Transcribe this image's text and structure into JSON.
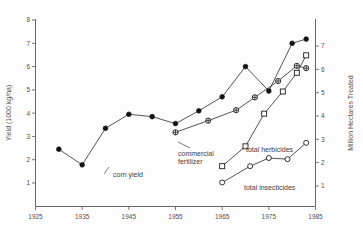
{
  "chart_data": {
    "type": "line",
    "title": "",
    "xlabel": "",
    "ylabel": "Yield  (1000 kg/ha)",
    "y2label": "Million Hectares Treated",
    "xlim": [
      1925,
      1985
    ],
    "ylim": [
      0,
      8
    ],
    "y2lim": [
      0,
      7.5
    ],
    "grid": false,
    "legend_position": "inline-annotations",
    "xticks": [
      "1925",
      "1935",
      "1945",
      "1955",
      "1965",
      "1975",
      "1985"
    ],
    "xtick_values": [
      1925,
      1935,
      1945,
      1955,
      1965,
      1975,
      1985
    ],
    "yticks": [
      "1",
      "2",
      "3",
      "4",
      "5",
      "6",
      "7",
      "8"
    ],
    "ytick_values": [
      1,
      2,
      3,
      4,
      5,
      6,
      7,
      8
    ],
    "y2ticks": [
      "1",
      "2",
      "3",
      "4",
      "5",
      "6",
      "7"
    ],
    "y2tick_values": [
      1,
      2,
      3,
      4,
      5,
      6,
      7
    ],
    "series": [
      {
        "name": "corn yield",
        "axis": "left",
        "marker": "filled-circle",
        "label": "corn yield",
        "x": [
          1930,
          1935,
          1940,
          1945,
          1950,
          1955,
          1960,
          1965,
          1970,
          1975,
          1980,
          1983
        ],
        "values": [
          2.45,
          1.78,
          3.35,
          3.95,
          3.85,
          3.55,
          4.1,
          4.7,
          6.0,
          4.95,
          7.0,
          7.18
        ]
      },
      {
        "name": "commercial fertilizer",
        "axis": "right",
        "marker": "crossed-circle",
        "label": "commercial fertilizer",
        "x": [
          1955,
          1962,
          1968,
          1972,
          1977,
          1981,
          1983
        ],
        "values": [
          3.3,
          3.8,
          4.25,
          4.8,
          5.5,
          6.15,
          6.05
        ]
      },
      {
        "name": "total herbicides",
        "axis": "right",
        "marker": "open-square",
        "label": "total herbicides",
        "x": [
          1965,
          1970,
          1974,
          1978,
          1981,
          1983
        ],
        "values": [
          1.85,
          2.7,
          4.1,
          5.05,
          5.85,
          6.6
        ]
      },
      {
        "name": "total insecticides",
        "axis": "right",
        "marker": "open-circle",
        "label": "total insecticides",
        "x": [
          1965,
          1971,
          1975,
          1979,
          1983
        ],
        "values": [
          1.15,
          1.85,
          2.2,
          2.15,
          2.85
        ]
      }
    ],
    "annotations": [
      {
        "text": "corn yield",
        "series": "corn yield"
      },
      {
        "text": "commercial fertilizer",
        "series": "commercial fertilizer"
      },
      {
        "text": "total herbicides",
        "series": "total herbicides"
      },
      {
        "text": "total insecticides",
        "series": "total insecticides"
      }
    ]
  }
}
